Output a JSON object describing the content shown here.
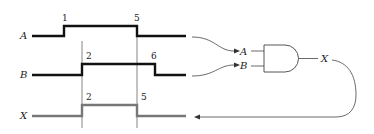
{
  "diagram": {
    "type": "timing-diagram-with-and-gate",
    "signals": [
      {
        "name": "A",
        "label_text": "A",
        "rise_label": "1",
        "fall_label": "5",
        "color": "#111111"
      },
      {
        "name": "B",
        "label_text": "B",
        "rise_label": "2",
        "fall_label": "6",
        "color": "#111111"
      },
      {
        "name": "X",
        "label_text": "X",
        "rise_label": "2",
        "fall_label": "5",
        "color": "#777777"
      }
    ],
    "gate": {
      "type": "AND",
      "inputs": [
        "A",
        "B"
      ],
      "output": "X"
    },
    "colors": {
      "waveform": "#111111",
      "output_waveform": "#777777",
      "guide_lines": "#555555",
      "connectors": "#444444"
    }
  }
}
